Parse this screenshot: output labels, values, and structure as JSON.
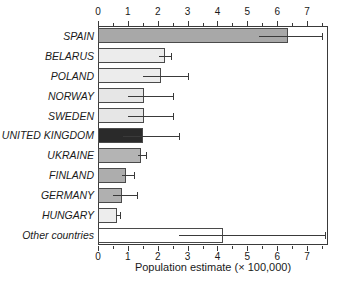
{
  "chart_data": {
    "type": "bar",
    "orientation": "horizontal",
    "title": "",
    "subtitle": "",
    "xlabel": "Population estimate (× 100,000)",
    "ylabel": "",
    "xlim": [
      0,
      7.7
    ],
    "xticks": [
      0,
      1,
      2,
      3,
      4,
      5,
      6,
      7
    ],
    "xticklabels": [
      "0",
      "1",
      "2",
      "3",
      "4",
      "5",
      "6",
      "7"
    ],
    "minor_tick_interval": 0.5,
    "grid": false,
    "legend": null,
    "axis_top": true,
    "axis_bottom": true,
    "categories": [
      "SPAIN",
      "BELARUS",
      "POLAND",
      "NORWAY",
      "SWEDEN",
      "UNITED KINGDOM",
      "UKRAINE",
      "FINLAND",
      "GERMANY",
      "HUNGARY",
      "Other countries"
    ],
    "values": [
      6.35,
      2.25,
      2.1,
      1.55,
      1.55,
      1.5,
      1.45,
      0.95,
      0.8,
      0.65,
      4.2
    ],
    "error_low": [
      5.4,
      2.05,
      1.5,
      1.0,
      1.0,
      0.85,
      1.35,
      0.8,
      0.5,
      0.6,
      2.7
    ],
    "error_high": [
      7.5,
      2.45,
      3.0,
      2.5,
      2.5,
      2.7,
      1.6,
      1.2,
      1.3,
      0.75,
      7.6
    ],
    "bar_colors": [
      "#a8a8a8",
      "#ececec",
      "#ececec",
      "#e6e6e6",
      "#e6e6e6",
      "#2a2a2a",
      "#b4b4b4",
      "#adadad",
      "#b0b0b0",
      "#ededed",
      "#ffffff"
    ],
    "bar_edge_color": "#4a4a4a",
    "error_color": "#3a3a3a",
    "axis_color": "#3a3a3a",
    "background": "#ffffff"
  }
}
